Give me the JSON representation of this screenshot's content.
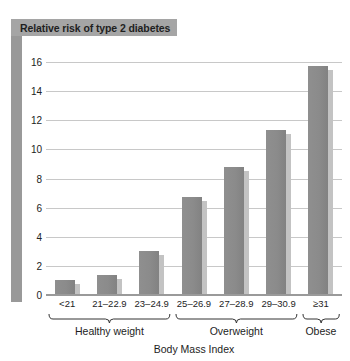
{
  "chart_data": {
    "type": "bar",
    "title": "Relative risk of type 2 diabetes",
    "xlabel": "Body Mass Index",
    "ylabel": "",
    "categories": [
      "<21",
      "21–22.9",
      "23–24.9",
      "25–26.9",
      "27–28.9",
      "29–30.9",
      "≥31"
    ],
    "values": [
      1.0,
      1.4,
      3.0,
      6.7,
      8.8,
      11.3,
      15.7
    ],
    "ylim": [
      0,
      16
    ],
    "yticks": [
      0,
      2,
      4,
      6,
      8,
      10,
      12,
      14,
      16
    ],
    "ytick_labels": [
      "0",
      "2",
      "4",
      "6",
      "8",
      "10",
      "12",
      "14",
      "16"
    ],
    "grid": true,
    "legend": false,
    "groups": [
      {
        "label": "Healthy weight",
        "start": 0,
        "end": 2
      },
      {
        "label": "Overweight",
        "start": 3,
        "end": 5
      },
      {
        "label": "Obese",
        "start": 6,
        "end": 6
      }
    ],
    "colors": {
      "bar": "#8b8b8b",
      "bar_shadow": "#c3c3c3",
      "title_plaque": "#a5a5a5",
      "left_band": "#999999",
      "gridline": "#c8c8c8",
      "axis": "#9a9a9a",
      "text": "#1d1d1d",
      "background": "#ffffff"
    }
  }
}
